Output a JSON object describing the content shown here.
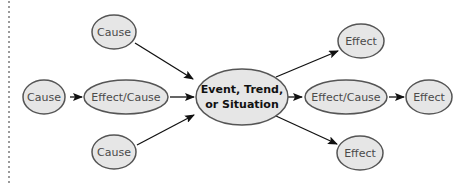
{
  "diagram": {
    "type": "cause-effect",
    "colors": {
      "node_fill": "#e6e6e6",
      "node_stroke": "#555555",
      "arrow": "#111111",
      "border_dots": "#9a9a9a"
    },
    "center": {
      "line1": "Event, Trend,",
      "line2": "or Situation"
    },
    "nodes": {
      "cause_top": "Cause",
      "cause_left": "Cause",
      "effect_cause_left": "Effect/Cause",
      "cause_bottom": "Cause",
      "effect_top": "Effect",
      "effect_cause_right": "Effect/Cause",
      "effect_right": "Effect",
      "effect_bottom": "Effect"
    },
    "edges": [
      {
        "from": "cause_top",
        "to": "center"
      },
      {
        "from": "cause_left",
        "to": "effect_cause_left"
      },
      {
        "from": "effect_cause_left",
        "to": "center"
      },
      {
        "from": "cause_bottom",
        "to": "center"
      },
      {
        "from": "center",
        "to": "effect_top"
      },
      {
        "from": "center",
        "to": "effect_cause_right"
      },
      {
        "from": "effect_cause_right",
        "to": "effect_right"
      },
      {
        "from": "center",
        "to": "effect_bottom"
      }
    ]
  }
}
